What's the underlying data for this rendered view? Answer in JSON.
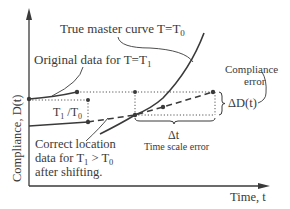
{
  "figure": {
    "y_axis_label": "Compliance, D(t)",
    "x_axis_label": "Time, t",
    "labels": {
      "master_curve": "True master curve T=T",
      "master_curve_sub": "0",
      "original_data": "Original data for T=T",
      "original_data_sub": "1",
      "shift_factor_T1": "T",
      "shift_factor_T1_sub": "1",
      "shift_factor_slash": " /T",
      "shift_factor_T0_sub": "0",
      "correct_location_line1": "Correct location",
      "correct_location_line2_a": "data for T",
      "correct_location_line2_sub1": "1",
      "correct_location_line2_b": " > T",
      "correct_location_line2_sub0": "0",
      "correct_location_line3": "after shifting.",
      "compliance_error_line1": "Compliance",
      "compliance_error_line2": "error",
      "delta_d": "ΔD(t)",
      "delta_t": "Δt",
      "time_scale_error": "Time scale error"
    },
    "colors": {
      "line": "#3a3a3a",
      "dotted": "#555555",
      "text": "#3a3a3a"
    }
  }
}
